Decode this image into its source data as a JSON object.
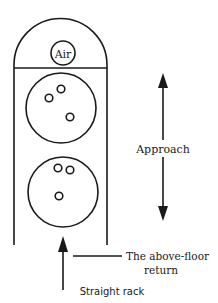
{
  "diagram": {
    "type": "ball-return-rack-schematic",
    "stroke_color": "#1a1a1a",
    "background": "#ffffff",
    "air_vent": {
      "label": "Air"
    },
    "balls": [
      {
        "name": "ball-1",
        "finger_holes": 3
      },
      {
        "name": "ball-2",
        "finger_holes": 3
      }
    ],
    "labels": {
      "approach": "Approach",
      "return_line1": "The above-floor",
      "return_line2": "return",
      "rack": "Straight rack"
    }
  }
}
